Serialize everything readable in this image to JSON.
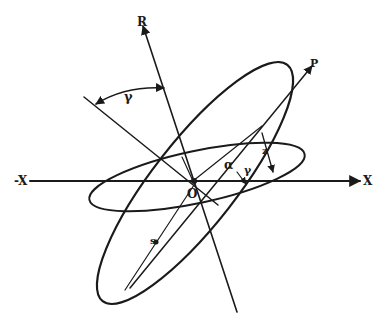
{
  "diagram": {
    "type": "geometric-construction",
    "stroke_color": "#1a1a1a",
    "background": "#ffffff",
    "axes": {
      "x_pos": "X",
      "x_neg": "-X"
    },
    "rays": {
      "R": "R",
      "P": "P"
    },
    "origin": "O",
    "angles": {
      "gamma_top": "γ",
      "alpha": "α",
      "gamma_inner": "γ"
    },
    "lengths": {
      "z": "z",
      "s": "s"
    },
    "shapes": [
      {
        "name": "large-ellipse",
        "description": "tilted ellipse along P direction"
      },
      {
        "name": "small-ellipse",
        "description": "flatter tilted ellipse around X axis"
      }
    ]
  }
}
